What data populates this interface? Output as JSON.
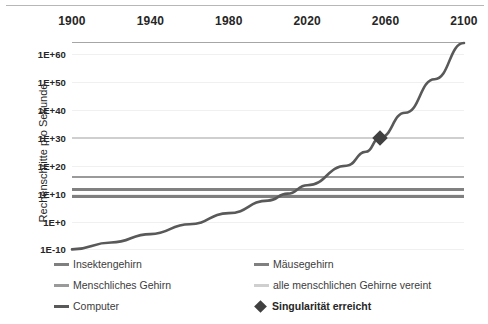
{
  "chart_data": {
    "type": "line",
    "title": "",
    "xlabel": "",
    "ylabel": "Rechenschritte pro Sekunde",
    "x_ticks": [
      1900,
      1940,
      1980,
      2020,
      2060,
      2100
    ],
    "x_tick_labels": [
      "1900",
      "1940",
      "1980",
      "2020",
      "2060",
      "2100"
    ],
    "xlim": [
      1900,
      2100
    ],
    "y_tick_labels": [
      "1E+60",
      "1E+50",
      "1E+40",
      "1E+30",
      "1E+20",
      "1E+10",
      "1E+0",
      "1E-10"
    ],
    "y_tick_exponents": [
      60,
      50,
      40,
      30,
      20,
      10,
      0,
      -10
    ],
    "ylim_exponent": [
      -12,
      64
    ],
    "y_scale": "log",
    "grid": true,
    "axis_position": "top",
    "legend_position": "bottom",
    "series": [
      {
        "name": "Insektengehirn",
        "type": "horizontal-line",
        "value_exponent": 9,
        "color": "#7f7f7f",
        "width": 2.2
      },
      {
        "name": "Mäusegehirn",
        "type": "horizontal-line",
        "value_exponent": 11.5,
        "color": "#808080",
        "width": 2.2
      },
      {
        "name": "Menschliches Gehirn",
        "type": "horizontal-line",
        "value_exponent": 16,
        "color": "#9a9a9a",
        "width": 2.2
      },
      {
        "name": "alle menschlichen Gehirne vereint",
        "type": "horizontal-line",
        "value_exponent": 30,
        "color": "#cfcfcf",
        "width": 2.6
      },
      {
        "name": "Computer",
        "type": "curve",
        "color": "#595959",
        "width": 2.6,
        "points": [
          {
            "year": 1900,
            "exponent": -10.0
          },
          {
            "year": 1920,
            "exponent": -7.5
          },
          {
            "year": 1940,
            "exponent": -4.5
          },
          {
            "year": 1960,
            "exponent": -1.0
          },
          {
            "year": 1980,
            "exponent": 3.0
          },
          {
            "year": 2000,
            "exponent": 7.5
          },
          {
            "year": 2010,
            "exponent": 10.0
          },
          {
            "year": 2020,
            "exponent": 13.0
          },
          {
            "year": 2040,
            "exponent": 20.0
          },
          {
            "year": 2050,
            "exponent": 25.0
          },
          {
            "year": 2057,
            "exponent": 30.0
          },
          {
            "year": 2070,
            "exponent": 39.0
          },
          {
            "year": 2085,
            "exponent": 51.0
          },
          {
            "year": 2100,
            "exponent": 64.0
          }
        ]
      }
    ],
    "annotations": [
      {
        "name": "Singularität erreicht",
        "type": "diamond-marker",
        "year": 2057,
        "exponent": 30,
        "color": "#404040"
      }
    ]
  },
  "y_axis": {
    "title": "Rechenschritte pro Sekunde"
  },
  "legend": {
    "items": [
      {
        "label": "Insektengehirn",
        "color": "#7f7f7f",
        "marker": "line",
        "bold": false
      },
      {
        "label": "Mäusegehirn",
        "color": "#808080",
        "marker": "line",
        "bold": false
      },
      {
        "label": "Menschliches Gehirn",
        "color": "#9a9a9a",
        "marker": "line",
        "bold": false
      },
      {
        "label": "alle menschlichen Gehirne vereint",
        "color": "#cfcfcf",
        "marker": "line",
        "bold": false
      },
      {
        "label": "Computer",
        "color": "#595959",
        "marker": "line",
        "bold": false
      },
      {
        "label": "Singularität erreicht",
        "color": "#404040",
        "marker": "diamond",
        "bold": true
      }
    ]
  },
  "colors": {
    "axis": "#a6a6a6",
    "grid": "#f0f0f0",
    "text": "#262626",
    "background": "#ffffff"
  }
}
